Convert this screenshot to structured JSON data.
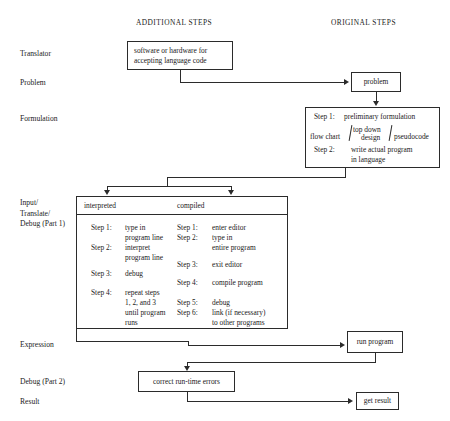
{
  "diagram": {
    "title_columns": {
      "additional": "ADDITIONAL STEPS",
      "original": "ORIGINAL STEPS"
    },
    "row_labels": [
      {
        "id": "translator",
        "text": "Translator"
      },
      {
        "id": "problem",
        "text": "Problem"
      },
      {
        "id": "formulation",
        "text": "Formulation"
      },
      {
        "id": "input-translate-debug",
        "line1": "Input/",
        "line2": "Translate/",
        "line3": "Debug (Part 1)"
      },
      {
        "id": "expression",
        "text": "Expression"
      },
      {
        "id": "debug-part-2",
        "text": "Debug (Part 2)"
      },
      {
        "id": "result",
        "text": "Result"
      }
    ],
    "boxes": {
      "translator": {
        "line1": "software or hardware for",
        "line2": "accepting language code"
      },
      "problem": {
        "label": "problem"
      },
      "formulation": {
        "step1_label": "Step 1:",
        "step1_text": "preliminary formulation",
        "method_left": "flow chart",
        "method_mid_line1": "top down",
        "method_mid_line2": "design",
        "method_right": "pseudocode",
        "step2_label": "Step 2:",
        "step2_line1": "write actual program",
        "step2_line2": "in language"
      },
      "run_program": {
        "label": "run program"
      },
      "correct_errors": {
        "label": "correct run-time errors"
      },
      "get_result": {
        "label": "get result"
      }
    },
    "matrix": {
      "headers": {
        "interpreted": "interpreted",
        "compiled": "compiled"
      },
      "interpreted_steps": [
        {
          "label": "Step 1:",
          "line1": "type in",
          "line2": "program line"
        },
        {
          "label": "Step 2:",
          "line1": "interpret",
          "line2": "program line"
        },
        {
          "label": "Step 3:",
          "line1": "debug",
          "line2": ""
        },
        {
          "label": "Step 4:",
          "line1": "repeat steps",
          "line2": "1, 2, and 3",
          "line3": "until program",
          "line4": "runs"
        }
      ],
      "compiled_steps": [
        {
          "label": "Step 1:",
          "line1": "enter editor",
          "line2": ""
        },
        {
          "label": "Step 2:",
          "line1": "type in",
          "line2": "entire program"
        },
        {
          "label": "Step 3:",
          "line1": "exit editor",
          "line2": ""
        },
        {
          "label": "Step 4:",
          "line1": "compile program",
          "line2": ""
        },
        {
          "label": "Step 5:",
          "line1": "debug",
          "line2": ""
        },
        {
          "label": "Step 6:",
          "line1": "link (if necessary)",
          "line2": "to other programs"
        }
      ]
    },
    "colors": {
      "stroke": "#2b2b2b",
      "text": "#1a1a1a",
      "background": "#ffffff"
    }
  }
}
